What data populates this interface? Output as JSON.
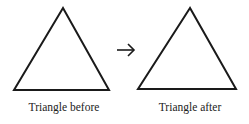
{
  "diagram": {
    "left": {
      "label": "Triangle before"
    },
    "right": {
      "label": "Triangle after"
    },
    "connector": {
      "symbol": "→"
    }
  }
}
